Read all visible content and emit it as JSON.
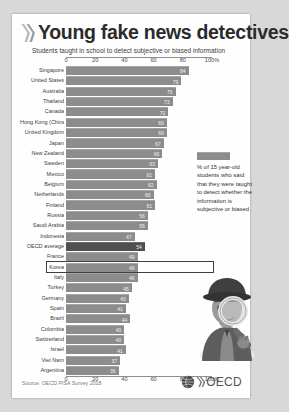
{
  "header": {
    "title": "Young fake news detectives",
    "subtitle": "Students taught in school to detect subjective or biased information",
    "chevron_icon": "double-chevron-right-icon"
  },
  "caption": {
    "text": "% of 15 year-old students who said that they were taught to detect whether the information is subjective or biased",
    "swatch_icon": "legend-swatch"
  },
  "illustration": {
    "icon": "detective-with-magnifying-glass-illustration"
  },
  "footer": {
    "source": "Source: OECD PISA Survey 2018",
    "logo_text": "OECD",
    "logo_icon": "oecd-globe-logo"
  },
  "colors": {
    "bar": "#8c8c8c",
    "bar_average": "#4f4f4f",
    "highlight_border": "#3f3f3f",
    "card": "#fefefe",
    "page": "#d8d8d8"
  },
  "chart_data": {
    "type": "bar",
    "orientation": "horizontal",
    "title": "Young fake news detectives",
    "subtitle": "Students taught in school to detect subjective or biased information",
    "xlabel": "",
    "ylabel": "",
    "xlim": [
      0,
      100
    ],
    "xticks": [
      0,
      20,
      40,
      60,
      80,
      100
    ],
    "xticklabels": [
      "0",
      "20",
      "40",
      "60",
      "80",
      "100%"
    ],
    "grid": false,
    "legend": "none",
    "axis_top": true,
    "axis_bottom": true,
    "highlighted_category": "Korea",
    "average_category": "OECD average",
    "categories": [
      "Singapore",
      "United States",
      "Australia",
      "Thailand",
      "Canada",
      "Hong Kong (China)",
      "United Kingdom",
      "Japan",
      "New Zealand",
      "Sweden",
      "Mexico",
      "Belgium",
      "Netherlands",
      "Finland",
      "Russia",
      "Saudi Arabia",
      "Indonesia",
      "OECD average",
      "France",
      "Korea",
      "Italy",
      "Turkey",
      "Germany",
      "Spain",
      "Brazil",
      "Colombia",
      "Switzerland",
      "Israel",
      "Viet Nam",
      "Argentina"
    ],
    "values": [
      84,
      79,
      75,
      73,
      70,
      69,
      69,
      67,
      66,
      63,
      61,
      62,
      60,
      61,
      56,
      56,
      47,
      54,
      49,
      49,
      49,
      45,
      43,
      41,
      44,
      40,
      40,
      41,
      37,
      36
    ]
  }
}
